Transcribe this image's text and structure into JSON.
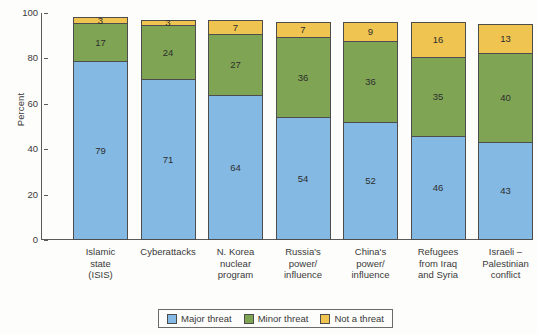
{
  "chart_data": {
    "type": "bar",
    "subtype": "stacked-bar-100",
    "title": "",
    "xlabel": "",
    "ylabel": "Percent",
    "ylim": [
      0,
      100
    ],
    "yticks": [
      0,
      20,
      40,
      60,
      80,
      100
    ],
    "grid": false,
    "legend_position": "bottom",
    "categories": [
      "Islamic state (ISIS)",
      "Cyberattacks",
      "N. Korea nuclear program",
      "Russia's power/influence",
      "China's power/influence",
      "Refugees from Iraq and Syria",
      "Israeli – Palestinian conflict"
    ],
    "category_lines": [
      [
        "Islamic",
        "state",
        "(ISIS)"
      ],
      [
        "Cyberattacks"
      ],
      [
        "N. Korea",
        "nuclear",
        "program"
      ],
      [
        "Russia's",
        "power/",
        "influence"
      ],
      [
        "China's",
        "power/",
        "influence"
      ],
      [
        "Refugees",
        "from Iraq",
        "and Syria"
      ],
      [
        "Israeli –",
        "Palestinian",
        "conflict"
      ]
    ],
    "series": [
      {
        "name": "Major threat",
        "color": "#84b9e3",
        "values": [
          79,
          71,
          64,
          54,
          52,
          46,
          43
        ]
      },
      {
        "name": "Minor threat",
        "color": "#7fa554",
        "values": [
          17,
          24,
          27,
          36,
          36,
          35,
          40
        ]
      },
      {
        "name": "Not a threat",
        "color": "#f0c450",
        "values": [
          3,
          3,
          7,
          7,
          9,
          16,
          13
        ]
      }
    ]
  },
  "axis": {
    "y_title": "Percent",
    "y_ticks": [
      "0",
      "20",
      "40",
      "60",
      "80",
      "100"
    ]
  },
  "legend": {
    "items": [
      {
        "label": "Major threat",
        "color": "#84b9e3"
      },
      {
        "label": "Minor threat",
        "color": "#7fa554"
      },
      {
        "label": "Not a threat",
        "color": "#f0c450"
      }
    ]
  }
}
